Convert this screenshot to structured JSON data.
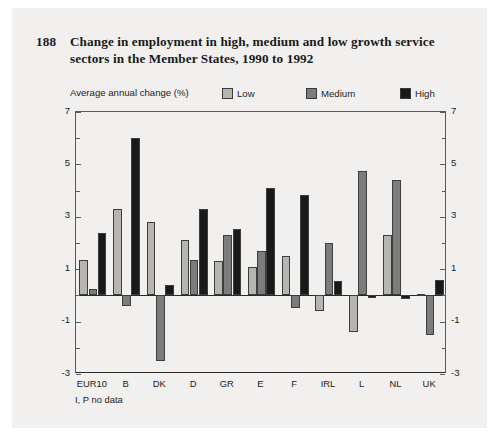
{
  "figure": {
    "number": "188",
    "title": "Change in employment in high, medium and low growth service sectors in the Member States, 1990 to 1992",
    "footnote": "I, P no data",
    "background_color": "#f1f0ee"
  },
  "chart_data": {
    "type": "bar",
    "title": "Change in employment in high, medium and low growth service sectors in the Member States, 1990 to 1992",
    "subtitle": "Average annual change (%)",
    "xlabel": "",
    "ylabel": "Average annual change (%)",
    "ylim": [
      -3,
      7
    ],
    "yticks": [
      -3,
      -1,
      1,
      3,
      5,
      7
    ],
    "ytick_labels": [
      "-3",
      "-1",
      "1",
      "3",
      "5",
      "7"
    ],
    "grid": false,
    "legend_position": "top-right",
    "axis_right_mirrored": true,
    "categories": [
      "EUR10",
      "B",
      "DK",
      "D",
      "GR",
      "E",
      "F",
      "IRL",
      "L",
      "NL",
      "UK"
    ],
    "series": [
      {
        "name": "Low",
        "color": "#b6b5b1",
        "values": [
          1.35,
          3.3,
          2.8,
          2.1,
          1.3,
          1.1,
          1.5,
          -0.6,
          -1.4,
          2.3,
          0.05
        ]
      },
      {
        "name": "Medium",
        "color": "#7c7c7c",
        "values": [
          0.25,
          -0.4,
          -2.5,
          1.35,
          2.3,
          1.7,
          -0.5,
          2.0,
          4.75,
          4.4,
          -1.5
        ]
      },
      {
        "name": "High",
        "color": "#191919",
        "values": [
          2.4,
          6.0,
          0.4,
          3.3,
          2.55,
          4.1,
          3.85,
          0.55,
          -0.1,
          -0.15,
          0.6
        ]
      }
    ],
    "annotations": [
      "I, P no data"
    ]
  },
  "legend": {
    "caption": "Average annual change (%)",
    "items": [
      {
        "label": "Low",
        "color": "#b6b5b1"
      },
      {
        "label": "Medium",
        "color": "#7c7c7c"
      },
      {
        "label": "High",
        "color": "#191919"
      }
    ]
  }
}
